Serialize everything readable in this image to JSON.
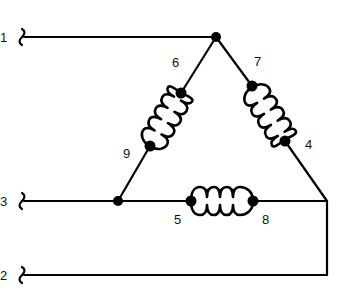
{
  "diagram": {
    "type": "delta-connected three-coil winding schematic",
    "line_labels": {
      "line1": "1",
      "line2": "2",
      "line3": "3"
    },
    "terminal_labels": {
      "t4": "4",
      "t5": "5",
      "t6": "6",
      "t7": "7",
      "t8": "8",
      "t9": "9"
    },
    "colors": {
      "ink": "#000000",
      "background": "#ffffff"
    }
  }
}
